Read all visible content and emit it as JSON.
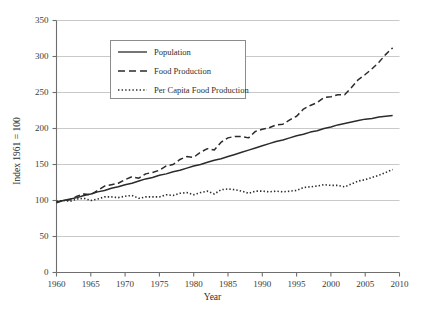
{
  "chart_data": {
    "type": "line",
    "title": "",
    "xlabel": "Year",
    "ylabel": "Index 1961 = 100",
    "xlim": [
      1960,
      2010
    ],
    "ylim": [
      0,
      350
    ],
    "xticks": [
      1960,
      1965,
      1970,
      1975,
      1980,
      1985,
      1990,
      1995,
      2000,
      2005,
      2010
    ],
    "yticks": [
      0,
      50,
      100,
      150,
      200,
      250,
      300,
      350
    ],
    "grid": "horizontal",
    "legend_position": "upper-left-inside",
    "x": [
      1960,
      1961,
      1962,
      1963,
      1964,
      1965,
      1966,
      1967,
      1968,
      1969,
      1970,
      1971,
      1972,
      1973,
      1974,
      1975,
      1976,
      1977,
      1978,
      1979,
      1980,
      1981,
      1982,
      1983,
      1984,
      1985,
      1986,
      1987,
      1988,
      1989,
      1990,
      1991,
      1992,
      1993,
      1994,
      1995,
      1996,
      1997,
      1998,
      1999,
      2000,
      2001,
      2002,
      2003,
      2004,
      2005,
      2006,
      2007,
      2008,
      2009
    ],
    "series": [
      {
        "name": "Population",
        "style": "solid",
        "color": "#2b2b2b",
        "values": [
          98,
          100,
          102,
          104,
          107,
          109,
          112,
          114,
          117,
          119,
          122,
          124,
          127,
          130,
          132,
          135,
          137,
          140,
          142,
          145,
          148,
          150,
          153,
          156,
          158,
          161,
          164,
          167,
          170,
          173,
          176,
          179,
          182,
          184,
          187,
          190,
          192,
          195,
          197,
          200,
          202,
          205,
          207,
          209,
          211,
          213,
          214,
          216,
          217,
          218
        ]
      },
      {
        "name": "Food Production",
        "style": "dashed",
        "color": "#2b2b2b",
        "values": [
          97,
          100,
          101,
          106,
          109,
          108,
          114,
          120,
          122,
          124,
          129,
          133,
          131,
          137,
          139,
          142,
          148,
          150,
          157,
          161,
          160,
          167,
          172,
          170,
          181,
          187,
          189,
          189,
          187,
          196,
          199,
          201,
          205,
          206,
          212,
          217,
          227,
          232,
          236,
          243,
          244,
          247,
          247,
          257,
          268,
          275,
          283,
          292,
          303,
          312
        ]
      },
      {
        "name": "Per Capita Food Production",
        "style": "dotted",
        "color": "#2b2b2b",
        "values": [
          99,
          100,
          99,
          102,
          103,
          100,
          102,
          105,
          105,
          104,
          106,
          107,
          103,
          105,
          105,
          105,
          108,
          107,
          110,
          111,
          108,
          111,
          113,
          109,
          115,
          116,
          115,
          113,
          110,
          113,
          113,
          112,
          113,
          112,
          113,
          114,
          118,
          119,
          120,
          122,
          121,
          121,
          119,
          123,
          127,
          129,
          132,
          135,
          139,
          143
        ]
      }
    ]
  },
  "legend": {
    "items": [
      {
        "label": "Population",
        "style": "solid"
      },
      {
        "label": "Food Production",
        "style": "dashed"
      },
      {
        "label": "Per Capita Food Production",
        "style": "dotted"
      }
    ]
  }
}
